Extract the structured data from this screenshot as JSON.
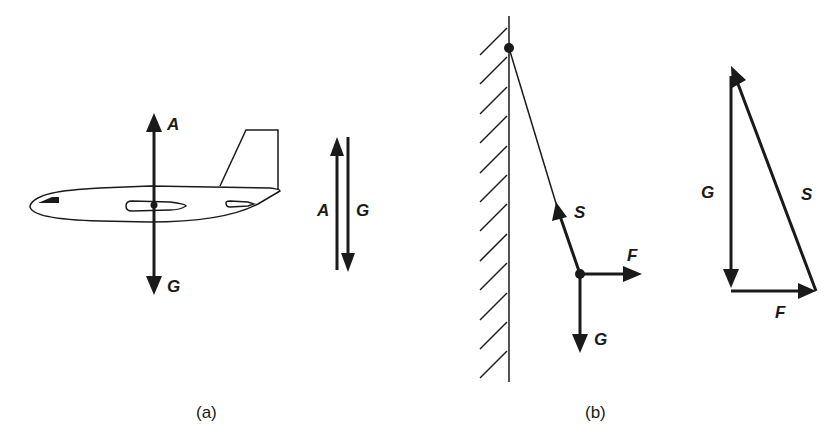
{
  "panels": [
    {
      "id": "a",
      "caption": "(a)",
      "subject": "airplane",
      "forces": [
        {
          "label": "A",
          "meaning": "lift",
          "direction": "up"
        },
        {
          "label": "G",
          "meaning": "weight",
          "direction": "down"
        }
      ],
      "vector_pair": {
        "left_label": "A",
        "right_label": "G"
      }
    },
    {
      "id": "b",
      "caption": "(b)",
      "subject": "pendulum on wall",
      "forces": [
        {
          "label": "S",
          "meaning": "string tension",
          "direction": "up-left along string"
        },
        {
          "label": "F",
          "meaning": "horizontal force",
          "direction": "right"
        },
        {
          "label": "G",
          "meaning": "weight",
          "direction": "down"
        }
      ],
      "triangle": {
        "g_label": "G",
        "s_label": "S",
        "f_label": "F"
      }
    }
  ],
  "colors": {
    "ink": "#1a1a1a",
    "background": "#ffffff"
  }
}
